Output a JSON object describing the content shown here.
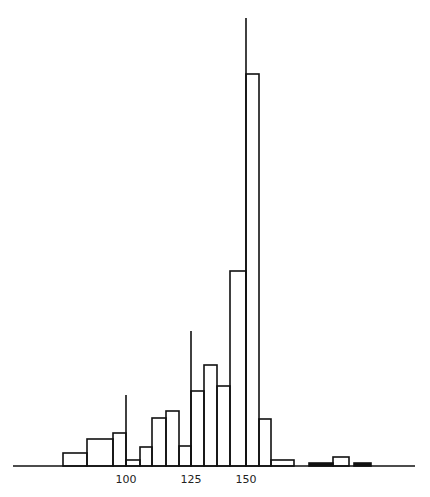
{
  "chart_data": {
    "type": "bar",
    "subtype": "histogram-step",
    "title": "",
    "xlabel": "",
    "ylabel": "",
    "grid": false,
    "legend": null,
    "x_ticks": [
      {
        "label": "100",
        "px": 126,
        "marker_top": 395
      },
      {
        "label": "125",
        "px": 191,
        "marker_top": 331
      },
      {
        "label": "150",
        "px": 246,
        "marker_top": 18
      }
    ],
    "baseline": {
      "y": 466,
      "x_start": 13,
      "x_end": 415
    },
    "bins": [
      {
        "x0": 63,
        "x1": 87,
        "height": 13,
        "fill": "none"
      },
      {
        "x0": 87,
        "x1": 113,
        "height": 27,
        "fill": "none"
      },
      {
        "x0": 113,
        "x1": 126,
        "height": 33,
        "fill": "none"
      },
      {
        "x0": 126,
        "x1": 140,
        "height": 6,
        "fill": "none"
      },
      {
        "x0": 140,
        "x1": 152,
        "height": 19,
        "fill": "none"
      },
      {
        "x0": 152,
        "x1": 166,
        "height": 48,
        "fill": "none"
      },
      {
        "x0": 166,
        "x1": 179,
        "height": 55,
        "fill": "none"
      },
      {
        "x0": 179,
        "x1": 191,
        "height": 20,
        "fill": "none"
      },
      {
        "x0": 191,
        "x1": 204,
        "height": 75,
        "fill": "none"
      },
      {
        "x0": 204,
        "x1": 217,
        "height": 101,
        "fill": "none"
      },
      {
        "x0": 217,
        "x1": 230,
        "height": 80,
        "fill": "none"
      },
      {
        "x0": 230,
        "x1": 246,
        "height": 195,
        "fill": "none"
      },
      {
        "x0": 246,
        "x1": 259,
        "height": 392,
        "fill": "none"
      },
      {
        "x0": 259,
        "x1": 271,
        "height": 47,
        "fill": "none"
      },
      {
        "x0": 271,
        "x1": 294,
        "height": 6,
        "fill": "none"
      },
      {
        "x0": 309,
        "x1": 333,
        "height": 3,
        "fill": "black"
      },
      {
        "x0": 333,
        "x1": 349,
        "height": 9,
        "fill": "none"
      },
      {
        "x0": 354,
        "x1": 371,
        "height": 3,
        "fill": "black"
      }
    ],
    "note": "Unlabeled y-axis; heights are relative units (pixels above baseline). Tall vertical marker lines at 100, 125, 150."
  }
}
